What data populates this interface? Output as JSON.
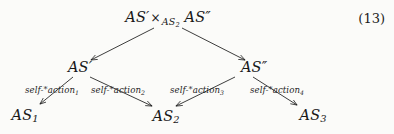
{
  "figure": {
    "equation_number": "(13)",
    "ink_color": "#1b1b1b",
    "background_color": "#fbfbf9"
  },
  "nodes": {
    "root": {
      "left_factor": "AS",
      "left_prime": "′",
      "times": "×",
      "base_label": "AS",
      "base_sub": "2",
      "right_factor": "AS",
      "right_prime": "″",
      "plain_text": "AS′ ×AS2 AS″"
    },
    "mid_left": {
      "label": "AS",
      "prime": "′",
      "plain_text": "AS′"
    },
    "mid_right": {
      "label": "AS",
      "prime": "″",
      "plain_text": "AS″"
    },
    "leaf_1": {
      "label": "AS",
      "sub": "1",
      "plain_text": "AS1"
    },
    "leaf_2": {
      "label": "AS",
      "sub": "2",
      "plain_text": "AS2"
    },
    "leaf_3": {
      "label": "AS",
      "sub": "3",
      "plain_text": "AS3"
    }
  },
  "edge_labels": [
    {
      "prefix": "self-",
      "star": "*",
      "word": "action",
      "sub": "1",
      "plain_text": "self-*action1"
    },
    {
      "prefix": "self-",
      "star": "*",
      "word": "action",
      "sub": "2",
      "plain_text": "self-*action2"
    },
    {
      "prefix": "self-",
      "star": "*",
      "word": "action",
      "sub": "3",
      "plain_text": "self-*action3"
    },
    {
      "prefix": "self-",
      "star": "*",
      "word": "action",
      "sub": "4",
      "plain_text": "self-*action4"
    }
  ]
}
